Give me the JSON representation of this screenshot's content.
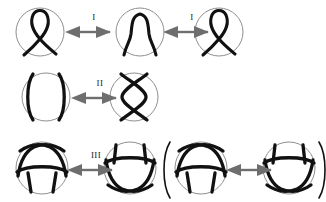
{
  "figure": {
    "background_color": "#ffffff",
    "stroke_color": "#111111",
    "circle_color": "#8c8c8c",
    "arrow_color": "#6e6e6e",
    "label_color": "#1a1a1a",
    "width": 326,
    "height": 202
  },
  "rows": [
    {
      "id": "row-1",
      "move": "I",
      "labels": [
        "I",
        "I"
      ],
      "diagrams": [
        {
          "id": "kink-left",
          "name": "loop-with-crossing",
          "cx": 40,
          "cy": 32,
          "r": 24
        },
        {
          "id": "arc-middle",
          "name": "plain-arc",
          "cx": 140,
          "cy": 32,
          "r": 24
        },
        {
          "id": "kink-right",
          "name": "loop-with-crossing",
          "cx": 219,
          "cy": 32,
          "r": 24
        }
      ],
      "arrows": [
        {
          "id": "arrow-1a",
          "x": 76,
          "y": 32,
          "length": 36
        },
        {
          "id": "arrow-1b",
          "x": 174,
          "y": 32,
          "length": 36
        }
      ]
    },
    {
      "id": "row-2",
      "move": "II",
      "labels": [
        "II"
      ],
      "diagrams": [
        {
          "id": "parallel-strands",
          "name": "two-parallel-strands",
          "cx": 46,
          "cy": 97,
          "r": 24
        },
        {
          "id": "crossed-strands",
          "name": "two-crossing-strands",
          "cx": 134,
          "cy": 97,
          "r": 24
        }
      ],
      "arrows": [
        {
          "id": "arrow-2a",
          "x": 82,
          "y": 97,
          "length": 36
        }
      ]
    },
    {
      "id": "row-3",
      "move": "III",
      "labels": [
        "III"
      ],
      "open_paren": "(",
      "close_paren": ")",
      "diagrams": [
        {
          "id": "triple-a",
          "name": "strand-below-crossing",
          "cx": 42,
          "cy": 168,
          "r": 26
        },
        {
          "id": "triple-b",
          "name": "strand-above-crossing",
          "cx": 130,
          "cy": 168,
          "r": 26
        },
        {
          "id": "triple-c",
          "name": "strand-below-crossing",
          "cx": 201,
          "cy": 168,
          "r": 26
        },
        {
          "id": "triple-d",
          "name": "strand-above-crossing",
          "cx": 289,
          "cy": 168,
          "r": 26
        }
      ],
      "arrows": [
        {
          "id": "arrow-3a",
          "x": 78,
          "y": 170,
          "length": 36
        },
        {
          "id": "arrow-3b",
          "x": 237,
          "y": 170,
          "length": 36
        }
      ]
    }
  ]
}
